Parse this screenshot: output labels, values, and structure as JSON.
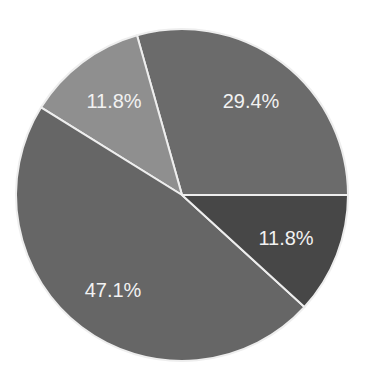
{
  "chart_data": {
    "type": "pie",
    "title": "",
    "categories": [
      "Slice A",
      "Slice B",
      "Slice C",
      "Slice D"
    ],
    "values": [
      29.4,
      11.8,
      47.1,
      11.8
    ],
    "labels": [
      "29.4%",
      "11.8%",
      "47.1%",
      "11.8%"
    ],
    "colors": [
      "#6b6b6b",
      "#8f8f8f",
      "#666666",
      "#474747"
    ],
    "start_angle_deg": 0,
    "direction": "counterclockwise",
    "legend": "none",
    "label_positions": [
      {
        "x": 251,
        "y": 101
      },
      {
        "x": 114,
        "y": 101
      },
      {
        "x": 113,
        "y": 290
      },
      {
        "x": 286,
        "y": 238
      }
    ]
  },
  "layout": {
    "cx": 182,
    "cy": 195,
    "r": 166
  }
}
